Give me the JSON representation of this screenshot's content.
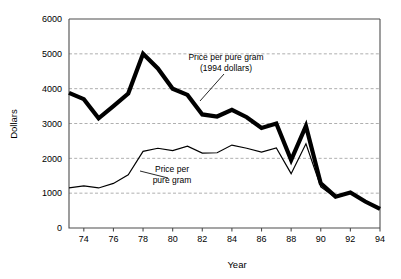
{
  "chart_data": {
    "type": "line",
    "title": "",
    "xlabel": "Year",
    "ylabel": "Dollars",
    "xlim": [
      73,
      94
    ],
    "ylim": [
      0,
      6000
    ],
    "grid": true,
    "legend_position": "inline-annotations",
    "x": [
      73,
      74,
      75,
      76,
      77,
      78,
      79,
      80,
      81,
      82,
      83,
      84,
      85,
      86,
      87,
      88,
      89,
      90,
      91,
      92,
      93,
      94
    ],
    "xtick_values": [
      74,
      76,
      78,
      80,
      82,
      84,
      86,
      88,
      90,
      92,
      94
    ],
    "xtick_labels": [
      "74",
      "76",
      "78",
      "80",
      "82",
      "84",
      "86",
      "88",
      "90",
      "92",
      "94"
    ],
    "ytick_values": [
      0,
      1000,
      2000,
      3000,
      4000,
      5000,
      6000
    ],
    "ytick_labels": [
      "0",
      "1000",
      "2000",
      "3000",
      "4000",
      "5000",
      "6000"
    ],
    "series": [
      {
        "name": "Price per pure gram (1994 dollars)",
        "style": "thick",
        "values": [
          3880,
          3700,
          3150,
          3500,
          3860,
          5000,
          4580,
          4000,
          3820,
          3260,
          3200,
          3390,
          3180,
          2870,
          3000,
          1950,
          2930,
          1280,
          900,
          1020,
          760,
          550
        ]
      },
      {
        "name": "Price per pure gram",
        "style": "thin",
        "values": [
          1150,
          1210,
          1150,
          1280,
          1530,
          2200,
          2290,
          2220,
          2350,
          2150,
          2160,
          2380,
          2290,
          2180,
          2300,
          1560,
          2420,
          1180,
          870,
          1000,
          750,
          545
        ]
      }
    ],
    "annotations": [
      {
        "id": "annotation-real-dollars",
        "lines": [
          "Price per pure gram",
          "(1994 dollars)"
        ],
        "text_x": 226,
        "text_y": 60,
        "leader": [
          [
            224,
            74
          ],
          [
            200,
            101
          ]
        ]
      },
      {
        "id": "annotation-nominal",
        "lines": [
          "Price per",
          "pure gram"
        ],
        "text_x": 172,
        "text_y": 172,
        "leader": [
          [
            168,
            178
          ],
          [
            140,
            171
          ]
        ]
      }
    ]
  },
  "colors": {
    "line": "#000000",
    "grid": "#9a9a9a",
    "frame": "#4d4d4d",
    "background": "#ffffff",
    "text": "#000000"
  }
}
